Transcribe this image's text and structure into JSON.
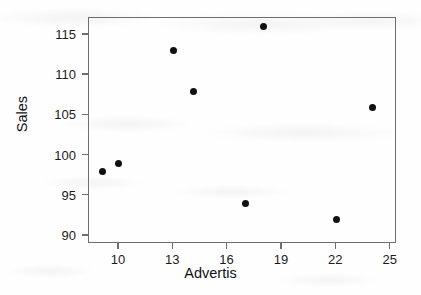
{
  "chart_data": {
    "type": "scatter",
    "title": "",
    "xlabel": "Advertis",
    "ylabel": "Sales",
    "xlim": [
      8.35,
      25.35
    ],
    "ylim": [
      89.0,
      117.1
    ],
    "grid": false,
    "legend": null,
    "xticks": [
      10,
      13,
      16,
      19,
      22,
      25
    ],
    "xtick_labels": [
      "10",
      "13",
      "16",
      "19",
      "22",
      "25"
    ],
    "yticks": [
      90,
      95,
      100,
      105,
      110,
      115
    ],
    "ytick_labels": [
      "90",
      "95",
      "100",
      "105",
      "110",
      "115"
    ],
    "marker": "filled-circle",
    "marker_color": "#111111",
    "points": [
      {
        "x": 9.1,
        "y": 98
      },
      {
        "x": 10,
        "y": 99
      },
      {
        "x": 13,
        "y": 113
      },
      {
        "x": 14.1,
        "y": 108
      },
      {
        "x": 17,
        "y": 94
      },
      {
        "x": 18,
        "y": 116
      },
      {
        "x": 22,
        "y": 92
      },
      {
        "x": 24,
        "y": 106
      }
    ],
    "x": [
      9.1,
      10,
      13,
      14.1,
      17,
      18,
      22,
      24
    ],
    "y": [
      98,
      99,
      113,
      108,
      94,
      116,
      92,
      106
    ]
  },
  "colors": {
    "axis": "#6e6e6e",
    "text": "#1c1c1c",
    "marker": "#111111",
    "background": "#fefefe"
  }
}
